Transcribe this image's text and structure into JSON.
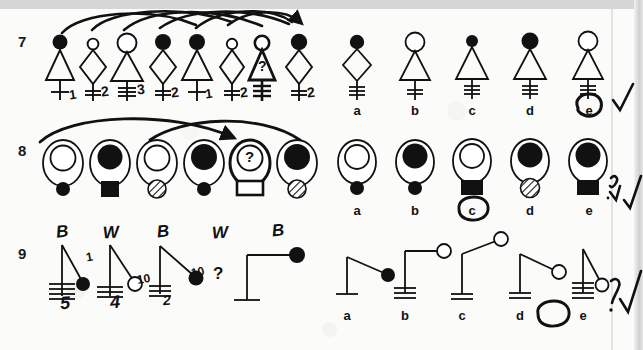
{
  "document": {
    "kind": "scanned-worksheet",
    "description": "Handwritten-annotated pictorial reasoning test, rows 7-9",
    "ink_color": "#111111",
    "pen_color": "#141414",
    "paper_color": "#fbfbfa"
  },
  "rows": [
    {
      "number": "7",
      "sequence_label": "row-7-sequence",
      "items": [
        {
          "head": "filled-circle",
          "body": "triangle",
          "ticks": 1,
          "handwritten_tick_count": "1",
          "marked": false
        },
        {
          "head": "small-open-circle",
          "body": "diamond",
          "ticks": 2,
          "handwritten_tick_count": "2",
          "marked": false
        },
        {
          "head": "large-open-circle",
          "body": "triangle",
          "ticks": 3,
          "handwritten_tick_count": "3",
          "marked": false
        },
        {
          "head": "filled-circle",
          "body": "diamond",
          "ticks": 2,
          "handwritten_tick_count": "2",
          "marked": false
        },
        {
          "head": "filled-circle",
          "body": "triangle",
          "ticks": 1,
          "handwritten_tick_count": "1",
          "marked": false
        },
        {
          "head": "small-open-circle",
          "body": "diamond",
          "ticks": 2,
          "handwritten_tick_count": "2",
          "marked": false
        },
        {
          "head": "open-circle",
          "body": "triangle",
          "ticks": 3,
          "handwritten_overlay": "?",
          "marked": true
        },
        {
          "head": "filled-circle",
          "body": "diamond",
          "ticks": 2,
          "handwritten_tick_count": "2",
          "marked": false
        }
      ],
      "arrows": "curved-links-between-heads",
      "options": [
        {
          "letter": "a",
          "head": "filled-circle",
          "body": "diamond",
          "ticks": 3,
          "circled": false
        },
        {
          "letter": "b",
          "head": "large-open-circle",
          "body": "triangle",
          "ticks": 2,
          "circled": false
        },
        {
          "letter": "c",
          "head": "small-filled-circle",
          "body": "triangle",
          "ticks": 3,
          "circled": false
        },
        {
          "letter": "d",
          "head": "filled-circle",
          "body": "triangle",
          "ticks": 3,
          "circled": false
        },
        {
          "letter": "e",
          "head": "large-open-circle",
          "body": "triangle",
          "ticks": 3,
          "circled": true
        }
      ],
      "check_mark": true
    },
    {
      "number": "8",
      "sequence_label": "row-8-sequence",
      "items": [
        {
          "inner": "open-circle",
          "below": "small-filled-circle",
          "marked": false
        },
        {
          "inner": "filled-circle",
          "below": "filled-square",
          "marked": false
        },
        {
          "inner": "open-circle",
          "below": "hatched-circle",
          "marked": false
        },
        {
          "inner": "filled-circle",
          "below": "small-filled-circle",
          "marked": false
        },
        {
          "inner": "open-circle",
          "below": "open-square",
          "handwritten_overlay": "?",
          "marked": true
        },
        {
          "inner": "filled-circle",
          "below": "hatched-circle",
          "marked": false
        }
      ],
      "arrows": "two-crossing-curved-arrows",
      "options": [
        {
          "letter": "a",
          "inner": "open-circle",
          "below": "small-filled-circle",
          "circled": false
        },
        {
          "letter": "b",
          "inner": "filled-circle",
          "below": "small-filled-circle",
          "circled": false
        },
        {
          "letter": "c",
          "inner": "open-circle",
          "below": "filled-square",
          "circled": true
        },
        {
          "letter": "d",
          "inner": "filled-circle",
          "below": "hatched-circle",
          "circled": false
        },
        {
          "letter": "e",
          "inner": "filled-circle",
          "below": "filled-square",
          "circled": false
        }
      ],
      "check_mark": true
    },
    {
      "number": "9",
      "sequence_label": "row-9-sequence",
      "items": [
        {
          "ball": "filled",
          "arm_angle": "steep-right",
          "ground_ticks": 4,
          "note_letter": "B",
          "note_number": "1",
          "handwritten_number_below": "5"
        },
        {
          "ball": "open",
          "arm_angle": "mid-right",
          "ground_ticks": 3,
          "note_letter": "W",
          "note_number": "10",
          "handwritten_number_below": "4"
        },
        {
          "ball": "filled",
          "arm_angle": "shallow-right",
          "ground_ticks": 3,
          "note_letter": "B",
          "note_number": "10",
          "handwritten_number_below": "2"
        },
        {
          "ball": "none",
          "arm_angle": "none",
          "ground_ticks": 0,
          "note_letter": "W",
          "is_question": true,
          "question_glyph": "?"
        },
        {
          "ball": "filled",
          "arm_angle": "horizontal",
          "ground_ticks": 1,
          "note_letter": "B"
        }
      ],
      "options": [
        {
          "letter": "a",
          "ball": "filled",
          "arm_angle": "down-right",
          "ground_ticks": 1,
          "circled": false
        },
        {
          "letter": "b",
          "ball": "open",
          "arm_angle": "horizontal",
          "ground_ticks": 3,
          "circled": false
        },
        {
          "letter": "c",
          "ball": "open",
          "arm_angle": "up-right",
          "ground_ticks": 2,
          "circled": false
        },
        {
          "letter": "d",
          "ball": "open",
          "arm_angle": "down-right",
          "ground_ticks": 2,
          "circled": true
        },
        {
          "letter": "e",
          "ball": "open",
          "arm_angle": "steep-down",
          "ground_ticks": 4,
          "circled": false
        }
      ],
      "marginal_marks": [
        "?",
        "check"
      ],
      "check_mark": true
    }
  ],
  "annotations": {
    "check_glyph": "✓",
    "question_glyph": "?",
    "letters": [
      "B",
      "W",
      "B",
      "W",
      "B"
    ],
    "numbers_row9": [
      "1",
      "10",
      "10"
    ],
    "numbers_below_row9": [
      "5",
      "4",
      "2"
    ]
  }
}
